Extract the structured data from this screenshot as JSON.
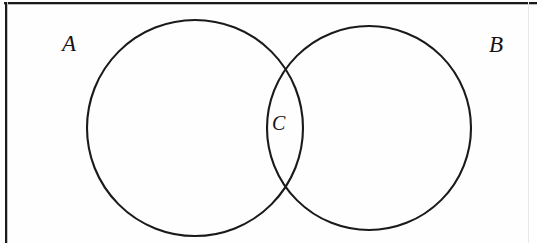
{
  "figure": {
    "type": "venn-diagram",
    "background_color": "#ffffff",
    "stroke_color": "#1a1a1a",
    "frame": {
      "present": true,
      "border_color": "#1a1a1a",
      "left_x": 5,
      "top_y": 2,
      "right_x": 528,
      "thickness_px": 2
    },
    "labels": {
      "set_a": "A",
      "set_b": "B",
      "intersection_c": "C"
    },
    "circles": [
      {
        "name": "circle-a",
        "label": "A",
        "cx": 195,
        "cy": 128,
        "r": 108,
        "stroke": "#1a1a1a",
        "stroke_width": 2,
        "fill": "none"
      },
      {
        "name": "circle-b",
        "label": "B",
        "cx": 369,
        "cy": 128,
        "r": 102,
        "stroke": "#1a1a1a",
        "stroke_width": 2,
        "fill": "none"
      }
    ],
    "intersections": [
      {
        "name": "upper-crossing",
        "x": 282,
        "y": 60
      },
      {
        "name": "lower-crossing",
        "x": 282,
        "y": 198
      }
    ],
    "label_positions": {
      "a": {
        "x": 62,
        "y": 32
      },
      "b": {
        "x": 489,
        "y": 33
      },
      "c": {
        "x": 272,
        "y": 113
      }
    }
  }
}
